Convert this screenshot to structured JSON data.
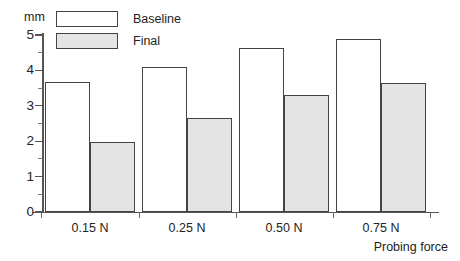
{
  "chart_data": {
    "type": "bar",
    "title": "",
    "subtitle": "",
    "categories": [
      "0.15 N",
      "0.25 N",
      "0.50 N",
      "0.75 N"
    ],
    "series": [
      {
        "name": "Baseline",
        "values": [
          3.68,
          4.11,
          4.64,
          4.89
        ],
        "fill": "#ffffff",
        "stroke": "#444444"
      },
      {
        "name": "Final",
        "values": [
          1.98,
          2.65,
          3.3,
          3.65
        ],
        "fill": "#e4e4e4",
        "stroke": "#444444"
      }
    ],
    "xlabel": "Probing force",
    "ylabel": "",
    "yunit": "mm",
    "ylim": [
      0,
      5
    ],
    "ytick_labels": [
      "0",
      "1",
      "2",
      "3",
      "4",
      "5"
    ],
    "ytick_values": [
      0,
      1,
      2,
      3,
      4,
      5
    ],
    "yminor_values": [
      0.5,
      1.5,
      2.5,
      3.5,
      4.5
    ],
    "grid": false,
    "legend_position": "top-left"
  },
  "figure": {
    "background": "#ffffff",
    "axis_color": "#555555",
    "text_color": "#232323"
  }
}
